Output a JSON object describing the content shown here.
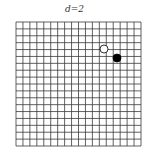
{
  "title": "d=2",
  "grid": {
    "rows": 18,
    "cols": 18,
    "x0": 16,
    "y0": 22,
    "x1": 141,
    "y1": 146,
    "line_color": "#3a3a3a"
  },
  "markers": [
    {
      "type": "open-circle",
      "cx": 104,
      "cy": 49,
      "r": 4,
      "fill": "#ffffff",
      "stroke": "#000000"
    },
    {
      "type": "filled-circle",
      "cx": 117,
      "cy": 58,
      "r": 4,
      "fill": "#000000",
      "stroke": "#000000"
    }
  ]
}
